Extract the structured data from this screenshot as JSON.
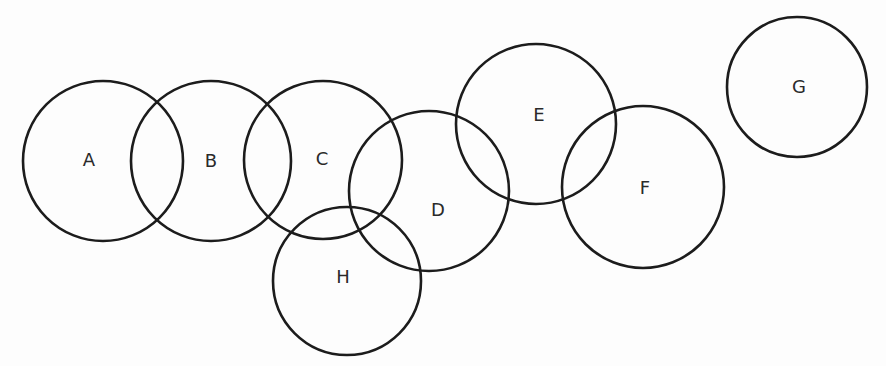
{
  "diagram": {
    "title": "",
    "type": "overlapping-circles",
    "circles": [
      {
        "id": "A",
        "label": "A",
        "cx": 103,
        "cy": 161,
        "r": 80,
        "label_x": 89,
        "label_y": 161
      },
      {
        "id": "B",
        "label": "B",
        "cx": 211,
        "cy": 161,
        "r": 80,
        "label_x": 211,
        "label_y": 162
      },
      {
        "id": "C",
        "label": "C",
        "cx": 323,
        "cy": 160,
        "r": 79,
        "label_x": 322,
        "label_y": 160
      },
      {
        "id": "D",
        "label": "D",
        "cx": 429,
        "cy": 191,
        "r": 80,
        "label_x": 438,
        "label_y": 211
      },
      {
        "id": "E",
        "label": "E",
        "cx": 536,
        "cy": 124,
        "r": 80,
        "label_x": 539,
        "label_y": 116
      },
      {
        "id": "F",
        "label": "F",
        "cx": 643,
        "cy": 187,
        "r": 81,
        "label_x": 645,
        "label_y": 189
      },
      {
        "id": "G",
        "label": "G",
        "cx": 797,
        "cy": 87,
        "r": 70,
        "label_x": 799,
        "label_y": 88
      },
      {
        "id": "H",
        "label": "H",
        "cx": 347,
        "cy": 281,
        "r": 74,
        "label_x": 343,
        "label_y": 278
      }
    ],
    "stroke_color": "#1c1c1c",
    "label_color": "#2a2a2a",
    "background": "#fdfdfd"
  }
}
